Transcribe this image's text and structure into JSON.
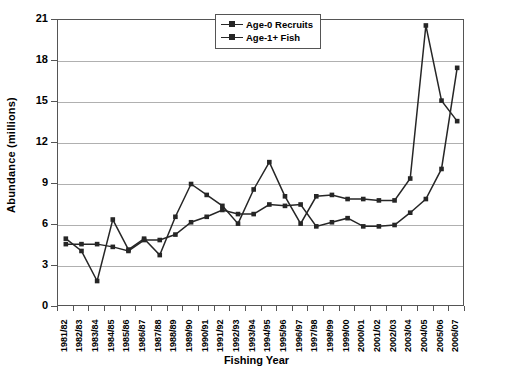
{
  "chart_data": {
    "type": "line",
    "title": "",
    "xlabel": "Fishing Year",
    "ylabel": "Abundance (millions)",
    "ylim": [
      0,
      21
    ],
    "yticks": [
      0,
      3,
      6,
      9,
      12,
      15,
      18,
      21
    ],
    "grid": true,
    "legend_position": "top-center-right",
    "categories": [
      "1981/82",
      "1982/83",
      "1983/84",
      "1984/85",
      "1985/86",
      "1986/87",
      "1987/88",
      "1988/89",
      "1989/90",
      "1990/91",
      "1991/92",
      "1992/93",
      "1993/94",
      "1994/95",
      "1995/96",
      "1996/97",
      "1997/98",
      "1998/99",
      "1999/00",
      "2000/01",
      "2001/02",
      "2002/03",
      "2003/04",
      "2004/05",
      "2005/06",
      "2006/07"
    ],
    "series": [
      {
        "name": "Age-0 Recruits",
        "color": "#262626",
        "values": [
          5.0,
          4.1,
          1.9,
          6.4,
          4.2,
          5.0,
          3.8,
          6.6,
          9.0,
          8.2,
          7.4,
          6.1,
          8.6,
          10.6,
          8.1,
          6.1,
          8.1,
          8.2,
          7.9,
          7.9,
          7.8,
          7.8,
          9.4,
          20.6,
          15.1,
          13.6
        ]
      },
      {
        "name": "Age-1+ Fish",
        "color": "#262626",
        "values": [
          4.6,
          4.6,
          4.6,
          4.4,
          4.1,
          4.9,
          4.9,
          5.3,
          6.2,
          6.6,
          7.1,
          6.8,
          6.8,
          7.5,
          7.4,
          7.5,
          5.9,
          6.2,
          6.5,
          5.9,
          5.9,
          6.0,
          6.9,
          7.9,
          10.1,
          17.5
        ]
      }
    ]
  },
  "legend": {
    "items": [
      {
        "label": "Age-0 Recruits"
      },
      {
        "label": "Age-1+ Fish"
      }
    ]
  },
  "colors": {
    "line": "#262626",
    "grid": "#b0b0b0",
    "frame": "#555555"
  }
}
